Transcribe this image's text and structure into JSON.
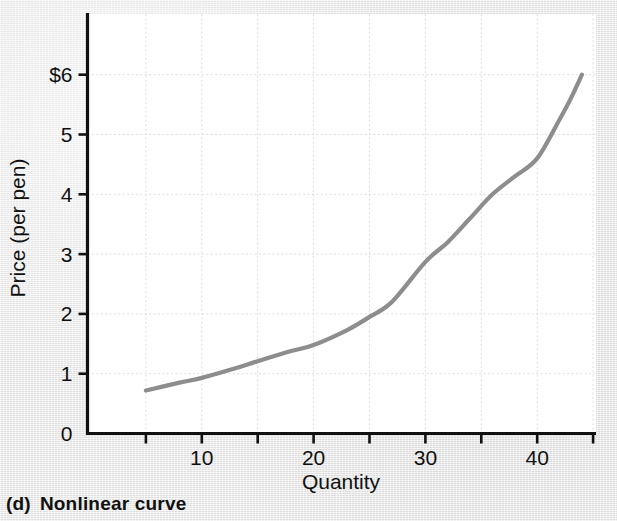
{
  "caption": {
    "tag": "(d)",
    "text": "Nonlinear curve"
  },
  "chart_data": {
    "type": "line",
    "title": "",
    "subtitle": "",
    "xlabel": "Quantity",
    "ylabel": "Price (per pen)",
    "xlim": [
      0,
      45.5
    ],
    "ylim": [
      0,
      7
    ],
    "grid": true,
    "legend": null,
    "curve_color": "#8d8d8d",
    "axis_color": "#111111",
    "grid_color": "#d9dde4",
    "plot_background": "#ffffff",
    "page_background": "#e8e8e8",
    "x_ticks": [
      0,
      5,
      10,
      15,
      20,
      25,
      30,
      35,
      40,
      45
    ],
    "x_tick_labels": [
      "",
      "",
      "10",
      "",
      "20",
      "",
      "30",
      "",
      "40",
      ""
    ],
    "y_ticks": [
      0,
      1,
      2,
      3,
      4,
      5,
      6
    ],
    "y_tick_labels": [
      "0",
      "1",
      "2",
      "3",
      "4",
      "5",
      "$6"
    ],
    "series": [
      {
        "name": "Nonlinear curve",
        "x": [
          5,
          8,
          10,
          13,
          15,
          18,
          20,
          23,
          25,
          27,
          30,
          32,
          34,
          36,
          38,
          40,
          42,
          43,
          44
        ],
        "values": [
          0.72,
          0.85,
          0.93,
          1.09,
          1.21,
          1.38,
          1.48,
          1.73,
          1.95,
          2.2,
          2.87,
          3.2,
          3.6,
          4.0,
          4.3,
          4.6,
          5.25,
          5.6,
          6.0
        ]
      }
    ],
    "annotations": []
  }
}
